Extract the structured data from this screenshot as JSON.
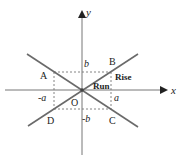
{
  "diagram": {
    "type": "coordinate-geometry",
    "colors": {
      "axis": "#777777",
      "line": "#6a6a6a",
      "dashed": "#777777",
      "text": "#222222"
    },
    "axes": {
      "x_label": "x",
      "y_label": "y"
    },
    "origin": {
      "label": "O"
    },
    "points": [
      {
        "id": "A",
        "label": "A"
      },
      {
        "id": "B",
        "label": "B"
      },
      {
        "id": "C",
        "label": "C"
      },
      {
        "id": "D",
        "label": "D"
      }
    ],
    "tick_labels": {
      "pos_b": "b",
      "neg_b": "-b",
      "pos_a": "a",
      "neg_a": "-a"
    },
    "annotations": {
      "rise": "Rise",
      "run": "Run"
    }
  }
}
